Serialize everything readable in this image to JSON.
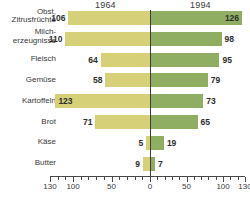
{
  "chart_data": {
    "type": "bar",
    "title": "",
    "subtitle": "",
    "orientation": "horizontal-diverging",
    "xlabel": "",
    "ylabel": "",
    "categories": [
      "Obst, Zitrusfrüchte",
      "Milcherzeugnisse",
      "Fleisch",
      "Gemüse",
      "Kartoffeln",
      "Brot",
      "Käse",
      "Butter"
    ],
    "series": [
      {
        "name": "1964",
        "side": "left",
        "color": "#d6d078",
        "values": [
          106,
          110,
          64,
          58,
          123,
          71,
          5,
          9
        ]
      },
      {
        "name": "1994",
        "side": "right",
        "color": "#8fae61",
        "values": [
          126,
          98,
          95,
          79,
          73,
          65,
          19,
          7
        ]
      }
    ],
    "xlim_left": [
      0,
      130
    ],
    "xlim_right": [
      0,
      130
    ],
    "tick_labels_left": [
      "130",
      "100",
      "50",
      "0"
    ],
    "tick_labels_right": [
      "0",
      "50",
      "100",
      "130"
    ],
    "tick_step_minor": 10,
    "grid": false,
    "legend": "column-headers"
  },
  "header": {
    "left_year": "1964",
    "right_year": "1994"
  },
  "rows": [
    {
      "label_line1": "Obst,",
      "label_line2": "Zitrusfrüchte",
      "left": "106",
      "right": "126",
      "left_inside": false,
      "right_inside": true
    },
    {
      "label_line1": "Milch-",
      "label_line2": "erzeugnisse",
      "left": "110",
      "right": "98",
      "left_inside": false,
      "right_inside": false
    },
    {
      "label_line1": "Fleisch",
      "label_line2": "",
      "left": "64",
      "right": "95",
      "left_inside": false,
      "right_inside": false
    },
    {
      "label_line1": "Gemüse",
      "label_line2": "",
      "left": "58",
      "right": "79",
      "left_inside": false,
      "right_inside": false
    },
    {
      "label_line1": "Kartoffeln",
      "label_line2": "",
      "left": "123",
      "right": "73",
      "left_inside": true,
      "right_inside": false
    },
    {
      "label_line1": "Brot",
      "label_line2": "",
      "left": "71",
      "right": "65",
      "left_inside": false,
      "right_inside": false
    },
    {
      "label_line1": "Käse",
      "label_line2": "",
      "left": "5",
      "right": "19",
      "left_inside": false,
      "right_inside": false
    },
    {
      "label_line1": "Butter",
      "label_line2": "",
      "left": "9",
      "right": "7",
      "left_inside": false,
      "right_inside": false
    }
  ],
  "axis": {
    "ticks": [
      {
        "label": "130",
        "side": "left",
        "value": 130
      },
      {
        "label": "100",
        "side": "left",
        "value": 100
      },
      {
        "label": "50",
        "side": "left",
        "value": 50
      },
      {
        "label": "0",
        "side": "left",
        "value": 0
      },
      {
        "label": "50",
        "side": "right",
        "value": 50
      },
      {
        "label": "100",
        "side": "right",
        "value": 100
      },
      {
        "label": "130",
        "side": "right",
        "value": 130
      }
    ]
  },
  "colors": {
    "left_bar": "#d6d078",
    "right_bar": "#8fae61",
    "axis": "#4a4a4a",
    "text": "#3a3a3a",
    "background": "#ffffff"
  }
}
